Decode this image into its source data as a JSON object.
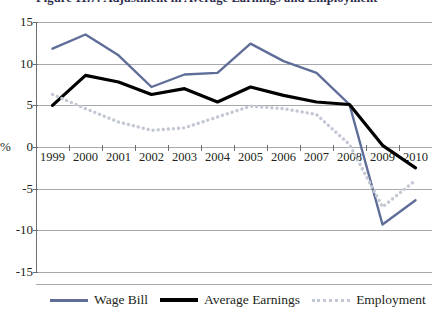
{
  "figure": {
    "title": "Figure 11.7: Adjustment in Average Earnings and Employment"
  },
  "colors": {
    "wage_bill": "#5f6d99",
    "average_earnings": "#000000",
    "employment": "#c3c8d4",
    "grid": "#a7a9ac",
    "axis": "#6d6e71"
  },
  "chart_data": {
    "type": "line",
    "title": "Figure 11.7: Adjustment in Average Earnings and Employment",
    "xlabel": "",
    "ylabel": "%",
    "x": [
      "1999",
      "2000",
      "2001",
      "2002",
      "2003",
      "2004",
      "2005",
      "2006",
      "2007",
      "2008",
      "2009",
      "2010"
    ],
    "ylim": [
      -15,
      15
    ],
    "yticks": [
      15,
      10,
      5,
      0,
      -5,
      -10,
      -15
    ],
    "ytick_labels": [
      "15",
      "10",
      "5",
      "0",
      "-5",
      "-10",
      "-15"
    ],
    "grid": true,
    "legend_position": "bottom",
    "series": [
      {
        "name": "Wage Bill",
        "color": "#5f6d99",
        "style": "solid",
        "values": [
          11.8,
          13.5,
          11.0,
          7.2,
          8.7,
          8.9,
          12.4,
          10.3,
          8.9,
          5.1,
          -9.3,
          -6.4
        ]
      },
      {
        "name": "Average Earnings",
        "color": "#000000",
        "style": "solid",
        "values": [
          5.0,
          8.6,
          7.8,
          6.3,
          7.0,
          5.4,
          7.2,
          6.2,
          5.4,
          5.1,
          0.2,
          -2.5
        ]
      },
      {
        "name": "Employment",
        "color": "#c3c8d4",
        "style": "dotted",
        "values": [
          6.3,
          4.6,
          3.0,
          2.0,
          2.3,
          3.6,
          4.9,
          4.6,
          3.9,
          0.3,
          -7.2,
          -4.0
        ]
      }
    ]
  },
  "legend": {
    "items": [
      {
        "label": "Wage Bill"
      },
      {
        "label": "Average Earnings"
      },
      {
        "label": "Employment"
      }
    ]
  }
}
